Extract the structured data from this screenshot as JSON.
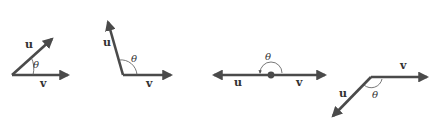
{
  "figure": {
    "colors": {
      "vector": "#4a4a4a",
      "label": "#333333",
      "background": "#ffffff"
    },
    "panels": [
      {
        "id": "acute",
        "u_label": "u",
        "v_label": "v",
        "angle_label": "θ"
      },
      {
        "id": "obtuse-like",
        "u_label": "u",
        "v_label": "v",
        "angle_label": "θ"
      },
      {
        "id": "straight",
        "u_label": "u",
        "v_label": "v",
        "angle_label": "θ"
      },
      {
        "id": "reflex-view",
        "u_label": "u",
        "v_label": "v",
        "angle_label": "θ"
      }
    ]
  }
}
